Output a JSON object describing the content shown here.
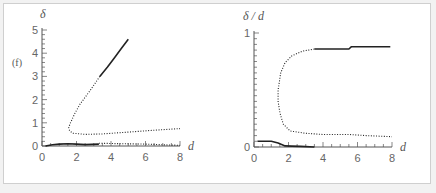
{
  "figure": {
    "panel_tag": "(f)",
    "colors": {
      "background": "#ffffff",
      "page": "#f2f2f2",
      "frame": "#cfcfcf",
      "line": "#222222",
      "axis": "#555555",
      "text": "#666666"
    }
  },
  "chart_data": [
    {
      "type": "line",
      "title": "",
      "panel_label": "(f)",
      "xlabel": "d",
      "ylabel": "δ",
      "xlim": [
        0,
        8
      ],
      "ylim": [
        0,
        5
      ],
      "xticks": [
        "0",
        "2",
        "4",
        "6",
        "8"
      ],
      "yticks": [
        "0",
        "1",
        "2",
        "3",
        "4",
        "5"
      ],
      "grid": false,
      "series": [
        {
          "name": "upper branch (stable)",
          "style": "solid",
          "x": [
            3.35,
            3.8,
            4.2,
            4.6,
            5.0
          ],
          "y": [
            3.0,
            3.4,
            3.8,
            4.2,
            4.6
          ]
        },
        {
          "name": "upper branch (unstable)",
          "style": "dotted",
          "x": [
            3.35,
            2.8,
            2.2,
            1.9,
            1.65,
            1.55,
            1.6,
            1.8,
            2.5,
            3.5,
            5.0,
            6.5,
            8.0
          ],
          "y": [
            3.0,
            2.4,
            1.8,
            1.4,
            1.0,
            0.8,
            0.65,
            0.55,
            0.5,
            0.52,
            0.6,
            0.68,
            0.75
          ]
        },
        {
          "name": "lower branch (stable)",
          "style": "solid",
          "x": [
            0.2,
            0.6,
            1.0,
            1.5,
            2.0,
            2.5,
            3.3
          ],
          "y": [
            0.0,
            0.05,
            0.08,
            0.1,
            0.08,
            0.06,
            0.08
          ]
        },
        {
          "name": "lower branch (unstable)",
          "style": "dotted",
          "x": [
            3.3,
            4.5,
            6.0,
            7.0,
            8.0
          ],
          "y": [
            0.12,
            0.1,
            0.08,
            0.05,
            0.03
          ]
        }
      ]
    },
    {
      "type": "line",
      "title": "",
      "xlabel": "d",
      "ylabel": "δ / d",
      "xlim": [
        0,
        8
      ],
      "ylim": [
        0,
        1
      ],
      "xticks": [
        "0",
        "2",
        "4",
        "6",
        "8"
      ],
      "yticks": [
        "0",
        "1"
      ],
      "grid": false,
      "series": [
        {
          "name": "upper branch (stable)",
          "style": "solid",
          "x": [
            3.5,
            4.0,
            5.5,
            5.65,
            7.9
          ],
          "y": [
            0.86,
            0.86,
            0.86,
            0.88,
            0.88
          ]
        },
        {
          "name": "upper branch (unstable)",
          "style": "dotted",
          "x": [
            3.5,
            2.8,
            2.2,
            1.8,
            1.55,
            1.4,
            1.4,
            1.5,
            1.7,
            2.1,
            3.0,
            4.0,
            5.5,
            6.5,
            8.0
          ],
          "y": [
            0.86,
            0.84,
            0.8,
            0.74,
            0.65,
            0.5,
            0.4,
            0.3,
            0.2,
            0.14,
            0.12,
            0.11,
            0.11,
            0.1,
            0.09
          ]
        },
        {
          "name": "lower branch (stable)",
          "style": "solid",
          "x": [
            0.2,
            0.6,
            1.0,
            1.4,
            1.8,
            2.2,
            2.7,
            3.5
          ],
          "y": [
            0.05,
            0.05,
            0.05,
            0.035,
            0.01,
            0.008,
            0.005,
            0.0
          ]
        }
      ]
    }
  ]
}
